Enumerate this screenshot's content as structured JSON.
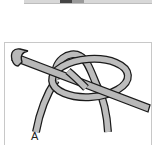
{
  "figure": {
    "label": "A",
    "colors": {
      "yarn_fill": "#bdbdbd",
      "hook_fill": "#b8b8b8",
      "outline": "#1a1a1a",
      "frame": "#c8c8c8"
    }
  }
}
